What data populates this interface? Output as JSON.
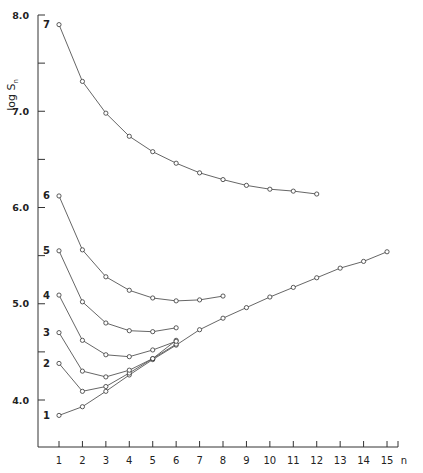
{
  "chart_data": {
    "type": "line",
    "title": "",
    "xlabel": "n",
    "ylabel": "log S_n",
    "ylabel_display": "log S",
    "ylabel_subscript": "n",
    "xlim": [
      0.1,
      15.5
    ],
    "ylim": [
      3.5,
      8.0
    ],
    "x_ticks": [
      1,
      2,
      3,
      4,
      5,
      6,
      7,
      8,
      9,
      10,
      11,
      12,
      13,
      14,
      15
    ],
    "y_ticks": [
      {
        "value": 8.0,
        "label": "8.0"
      },
      {
        "value": 7.5,
        "label": ""
      },
      {
        "value": 7.0,
        "label": "7.0"
      },
      {
        "value": 6.5,
        "label": ""
      },
      {
        "value": 6.0,
        "label": "6.0"
      },
      {
        "value": 5.5,
        "label": ""
      },
      {
        "value": 5.0,
        "label": "5.0"
      },
      {
        "value": 4.5,
        "label": ""
      },
      {
        "value": 4.0,
        "label": "4.0"
      }
    ],
    "grid": false,
    "legend": "inline curve labels at left of each series",
    "series": [
      {
        "name": "1",
        "x": [
          1,
          2,
          3,
          4,
          5,
          6,
          7,
          8,
          9,
          10,
          11,
          12,
          13,
          14,
          15
        ],
        "values": [
          3.84,
          3.93,
          4.09,
          4.26,
          4.42,
          4.57,
          4.73,
          4.85,
          4.96,
          5.07,
          5.17,
          5.27,
          5.37,
          5.44,
          5.54
        ]
      },
      {
        "name": "2",
        "x": [
          1,
          2,
          3,
          4,
          5,
          6
        ],
        "values": [
          4.38,
          4.09,
          4.14,
          4.28,
          4.43,
          4.58
        ]
      },
      {
        "name": "3",
        "x": [
          1,
          2,
          3,
          4,
          5,
          6
        ],
        "values": [
          4.7,
          4.3,
          4.24,
          4.31,
          4.43,
          4.62
        ]
      },
      {
        "name": "4",
        "x": [
          1,
          2,
          3,
          4,
          5,
          6
        ],
        "values": [
          5.09,
          4.62,
          4.47,
          4.45,
          4.52,
          4.61
        ]
      },
      {
        "name": "5",
        "x": [
          1,
          2,
          3,
          4,
          5,
          6
        ],
        "values": [
          5.55,
          5.02,
          4.8,
          4.72,
          4.71,
          4.75
        ]
      },
      {
        "name": "6",
        "x": [
          1,
          2,
          3,
          4,
          5,
          6,
          7,
          8
        ],
        "values": [
          6.12,
          5.56,
          5.28,
          5.14,
          5.06,
          5.03,
          5.04,
          5.08
        ]
      },
      {
        "name": "7",
        "x": [
          1,
          2,
          3,
          4,
          5,
          6,
          7,
          8,
          9,
          10,
          11,
          12
        ],
        "values": [
          7.9,
          7.31,
          6.98,
          6.74,
          6.58,
          6.46,
          6.36,
          6.29,
          6.23,
          6.19,
          6.17,
          6.14
        ]
      }
    ]
  }
}
